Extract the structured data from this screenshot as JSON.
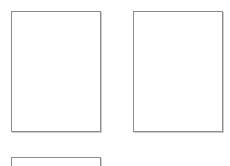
{
  "page": {
    "background_color": "#ffffff",
    "width": 230,
    "height": 166
  },
  "style": {
    "border_color": "#8c8c8c",
    "fill_color": "#ffffff",
    "shadow_color": "#a0a0a0"
  },
  "boxes": [
    {
      "id": "box-1",
      "label": "",
      "x": 11,
      "y": 11,
      "width": 90,
      "height": 121,
      "clipped": "false"
    },
    {
      "id": "box-2",
      "label": "",
      "x": 133,
      "y": 11,
      "width": 90,
      "height": 121,
      "clipped": "false"
    },
    {
      "id": "box-3",
      "label": "",
      "x": 11,
      "y": 157,
      "width": 90,
      "height": 121,
      "clipped": "true"
    }
  ]
}
